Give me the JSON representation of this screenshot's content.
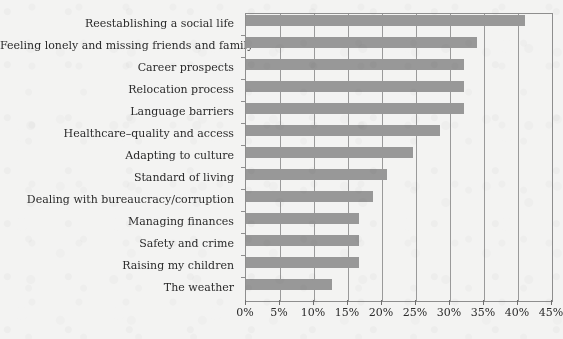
{
  "chart_data": {
    "type": "bar",
    "orientation": "horizontal",
    "title": "",
    "subtitle": "",
    "xlabel": "",
    "ylabel": "",
    "xlim": [
      0,
      45
    ],
    "grid": true,
    "legend": null,
    "tick_suffix": "%",
    "xticks": [
      0,
      5,
      10,
      15,
      20,
      25,
      30,
      35,
      40,
      45
    ],
    "xtick_labels": [
      "0%",
      "5%",
      "10%",
      "15%",
      "20%",
      "25%",
      "30%",
      "35%",
      "40%",
      "45%"
    ],
    "categories": [
      "Reestablishing a social life",
      "Feeling lonely and missing friends and family",
      "Career prospects",
      "Relocation process",
      "Language barriers",
      "Healthcare–quality and access",
      "Adapting to culture",
      "Standard of living",
      "Dealing with bureaucracy/corruption",
      "Managing finances",
      "Safety and crime",
      "Raising my children",
      "The weather"
    ],
    "values": [
      41,
      34,
      32,
      32,
      32,
      28.5,
      24.5,
      20.7,
      18.7,
      16.6,
      16.6,
      16.6,
      12.6
    ],
    "colors": {
      "bar": "#989898",
      "background": "#f3f3f2",
      "axis": "#8e8e8e",
      "gridline": "#9a9a9a",
      "text": "#2b2b2b"
    }
  }
}
